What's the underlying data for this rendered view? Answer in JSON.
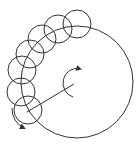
{
  "diagram": {
    "stroke_color": "#333333",
    "background": "#ffffff",
    "large_circle": {
      "cx": 77,
      "cy": 82,
      "r": 56
    },
    "small_circles": [
      {
        "cx": 77,
        "cy": 24,
        "r": 14
      },
      {
        "cx": 58,
        "cy": 29,
        "r": 14
      },
      {
        "cx": 42,
        "cy": 39,
        "r": 14
      },
      {
        "cx": 30,
        "cy": 54,
        "r": 14
      },
      {
        "cx": 22,
        "cy": 70,
        "r": 14
      },
      {
        "cx": 21,
        "cy": 92,
        "r": 14
      },
      {
        "cx": 28,
        "cy": 110,
        "r": 14
      }
    ],
    "radius_line": {
      "x1": 74,
      "y1": 84,
      "x2": 27,
      "y2": 112
    },
    "rotation_arrows": [
      {
        "name": "center-rotation-arrow",
        "direction": "clockwise"
      },
      {
        "name": "small-circle-rotation-arrow",
        "direction": "counterclockwise"
      }
    ]
  }
}
